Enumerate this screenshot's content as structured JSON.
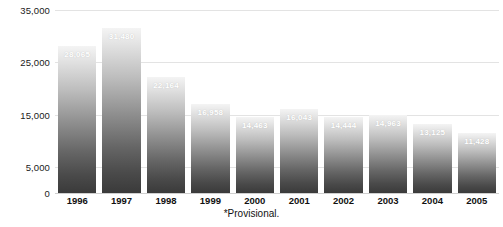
{
  "chart_data": {
    "type": "bar",
    "title": "",
    "xlabel": "",
    "ylabel": "",
    "categories": [
      "1996",
      "1997",
      "1998",
      "1999",
      "2000",
      "2001",
      "2002",
      "2003",
      "2004",
      "2005"
    ],
    "values": [
      28065,
      31480,
      22164,
      16958,
      14463,
      16043,
      14444,
      14963,
      13125,
      11428
    ],
    "value_labels": [
      "28,065",
      "31,480",
      "22,164",
      "16,958",
      "14,463",
      "16,043",
      "14,444",
      "14,963",
      "13,125",
      "11,428"
    ],
    "ylim": [
      0,
      35000
    ],
    "yticks": [
      0,
      5000,
      15000,
      25000,
      35000
    ],
    "ytick_labels": [
      "0",
      "5,000",
      "15,000",
      "25,000",
      "35,000"
    ],
    "grid": true,
    "legend": false,
    "bar_style": "vertical-gradient-grayscale",
    "colors": {
      "bar_top": "#f4f4f4",
      "bar_bottom": "#3a3a3a",
      "gridline": "#e3e3e3",
      "label_text": "#ffffff",
      "axis_text": "#111111",
      "background": "#ffffff"
    }
  },
  "footnote": {
    "text": "*Provisional."
  }
}
